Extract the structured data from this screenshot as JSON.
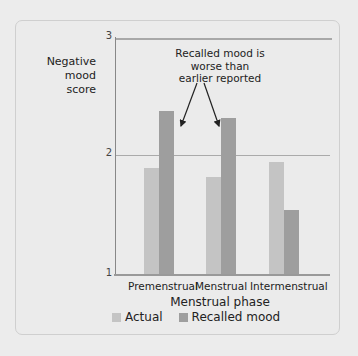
{
  "chart_data": {
    "type": "bar",
    "title": "",
    "xlabel": "Menstrual phase",
    "ylabel": "Negative mood score",
    "ylim": [
      1,
      3
    ],
    "yticks": [
      1,
      2,
      3
    ],
    "grid": true,
    "legend_position": "bottom",
    "categories": [
      "Premenstrual",
      "Menstrual",
      "Intermenstrual"
    ],
    "series": [
      {
        "name": "Actual",
        "color": "#c4c4c4",
        "values": [
          1.9,
          1.82,
          1.95
        ]
      },
      {
        "name": "Recalled mood",
        "color": "#9e9e9e",
        "values": [
          2.38,
          2.32,
          1.54
        ]
      }
    ],
    "annotation": "Recalled mood is worse than earlier reported"
  },
  "labels": {
    "ylabel_line1": "Negative mood",
    "ylabel_line2": "score",
    "tick_3": "3",
    "tick_2": "2",
    "tick_1": "1",
    "annot_line1": "Recalled mood is",
    "annot_line2": "worse than",
    "annot_line3": "earlier reported",
    "cat_0": "Premenstrual",
    "cat_1": "Menstrual",
    "cat_2": "Intermenstrual",
    "xlabel": "Menstrual phase",
    "legend_actual": "Actual",
    "legend_recalled": "Recalled mood"
  }
}
